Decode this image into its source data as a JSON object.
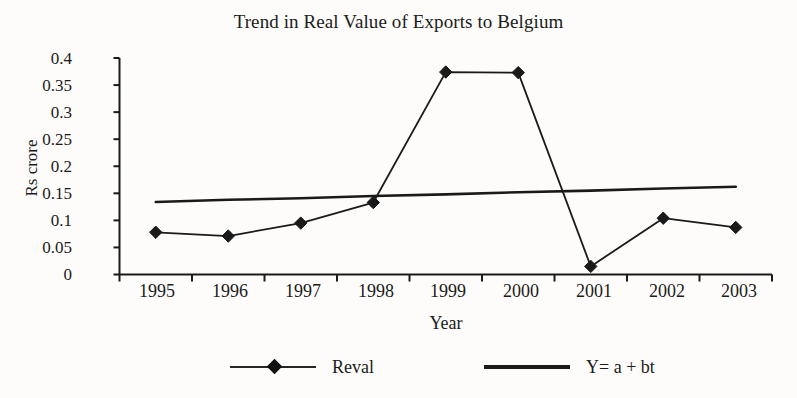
{
  "chart_data": {
    "type": "line",
    "title": "Trend in Real Value of Exports to Belgium",
    "xlabel": "Year",
    "ylabel": "Rs crore",
    "categories": [
      "1995",
      "1996",
      "1997",
      "1998",
      "1999",
      "2000",
      "2001",
      "2002",
      "2003"
    ],
    "ylim": [
      0,
      0.4
    ],
    "ytick_labels": [
      "0",
      "0.05",
      "0.1",
      "0.15",
      "0.2",
      "0.25",
      "0.3",
      "0.35",
      "0.4"
    ],
    "ytick_values": [
      0,
      0.05,
      0.1,
      0.15,
      0.2,
      0.25,
      0.3,
      0.35,
      0.4
    ],
    "grid": false,
    "legend_position": "bottom",
    "series": [
      {
        "name": "Reval",
        "marker": "diamond",
        "color": "#1a1a1a",
        "values": [
          0.078,
          0.071,
          0.095,
          0.133,
          0.374,
          0.373,
          0.015,
          0.104,
          0.087
        ]
      },
      {
        "name": "Y= a + bt",
        "marker": "none",
        "color": "#1a1a1a",
        "values": [
          0.134,
          0.138,
          0.141,
          0.145,
          0.148,
          0.152,
          0.155,
          0.159,
          0.162
        ]
      }
    ],
    "legend": [
      {
        "label": "Reval",
        "swatch": "line-with-diamond-marker"
      },
      {
        "label": "Y= a + bt",
        "swatch": "thick-line"
      }
    ]
  },
  "axes": {
    "y_title": "Rs crore",
    "x_title": "Year"
  }
}
